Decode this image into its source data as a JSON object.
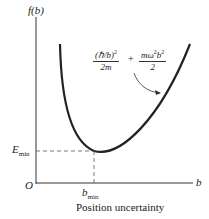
{
  "diagram": {
    "y_axis_label": "f(b)",
    "x_axis_var": "b",
    "origin": "O",
    "e_min_label": "E",
    "e_min_sub": "min",
    "b_min_label": "b",
    "b_min_sub": "min",
    "x_axis_title": "Position uncertainty",
    "formula": {
      "term1_num": "(ℏ/b)",
      "term1_num_exp": "2",
      "term1_den": "2m",
      "plus": "+",
      "term2_num": "mω",
      "term2_num_exp1": "2",
      "term2_num_b": "b",
      "term2_num_exp2": "2",
      "term2_den": "2"
    },
    "curve_color": "#222222",
    "dashed_color": "#555555"
  }
}
